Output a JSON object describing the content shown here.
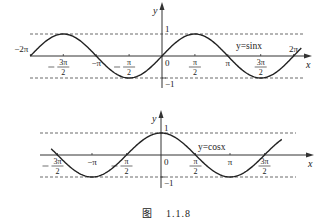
{
  "caption": {
    "prefix": "图",
    "number": "1.1.8"
  },
  "chart_data": [
    {
      "type": "line",
      "title": "y=sin x",
      "function": "sin",
      "label": "y=sinx",
      "xlabel": "x",
      "ylabel": "y",
      "x_range": [
        -6.2832,
        6.65
      ],
      "ylim": [
        -1,
        1
      ],
      "dashed_guides": [
        1,
        -1
      ],
      "y_tick_labels": [
        "1",
        "-1"
      ],
      "origin_label": "0",
      "x_tick_labels": [
        {
          "value": -6.2832,
          "text": "-2π",
          "pos": "above"
        },
        {
          "value": -4.7124,
          "num": "3π",
          "den": "2",
          "neg": true,
          "pos": "below"
        },
        {
          "value": -3.1416,
          "text": "-π",
          "pos": "below"
        },
        {
          "value": -1.5708,
          "num": "π",
          "den": "2",
          "neg": true,
          "pos": "below"
        },
        {
          "value": 1.5708,
          "num": "π",
          "den": "2",
          "neg": false,
          "pos": "below"
        },
        {
          "value": 3.1416,
          "text": "π",
          "pos": "below"
        },
        {
          "value": 4.7124,
          "num": "3π",
          "den": "2",
          "neg": false,
          "pos": "below"
        },
        {
          "value": 6.2832,
          "text": "2π",
          "pos": "above"
        }
      ],
      "layout": {
        "ox": 162,
        "oy": 56,
        "px_per_pi": 65.8,
        "amp": 22,
        "axis_x0": 30,
        "axis_x1": 308,
        "dash_x0": 30,
        "dash_x1": 305,
        "y_top": 6,
        "y_bot": 88,
        "label_x": 236,
        "label_y": 49
      }
    },
    {
      "type": "line",
      "title": "y=cos x",
      "function": "cos",
      "label": "y=cosx",
      "xlabel": "x",
      "ylabel": "y",
      "x_range": [
        -5.0,
        5.5
      ],
      "ylim": [
        -1,
        1
      ],
      "dashed_guides": [
        1,
        -1
      ],
      "y_tick_labels": [
        "1",
        "-1"
      ],
      "origin_label": "0",
      "x_tick_labels": [
        {
          "value": -4.7124,
          "num": "3π",
          "den": "2",
          "neg": true,
          "pos": "below"
        },
        {
          "value": -3.1416,
          "text": "-π",
          "pos": "below"
        },
        {
          "value": -1.5708,
          "num": "π",
          "den": "2",
          "neg": true,
          "pos": "below"
        },
        {
          "value": 1.5708,
          "num": "π",
          "den": "2",
          "neg": false,
          "pos": "below"
        },
        {
          "value": 3.1416,
          "text": "π",
          "pos": "below"
        },
        {
          "value": 4.7124,
          "num": "3π",
          "den": "2",
          "neg": false,
          "pos": "below"
        }
      ],
      "layout": {
        "ox": 161,
        "oy": 155,
        "px_per_pi": 69,
        "amp": 22,
        "axis_x0": 40,
        "axis_x1": 310,
        "dash_x0": 40,
        "dash_x1": 296,
        "y_top": 114,
        "y_bot": 188,
        "label_x": 198,
        "label_y": 150
      }
    }
  ]
}
